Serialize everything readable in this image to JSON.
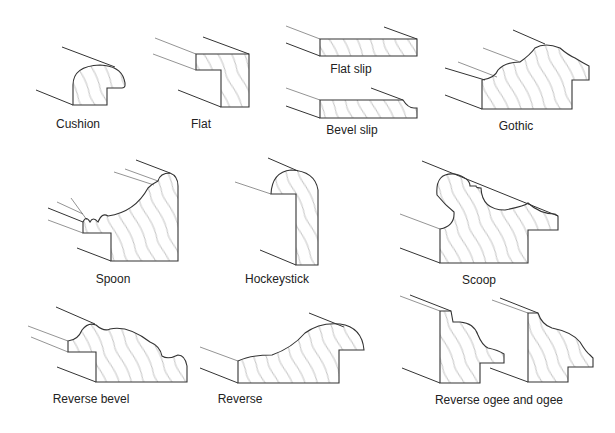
{
  "diagram": {
    "profiles": [
      {
        "id": "cushion",
        "label": "Cushion",
        "label_x": 78,
        "label_y": 117
      },
      {
        "id": "flat",
        "label": "Flat",
        "label_x": 201,
        "label_y": 117
      },
      {
        "id": "flat-slip",
        "label": "Flat slip",
        "label_x": 351,
        "label_y": 62
      },
      {
        "id": "bevel-slip",
        "label": "Bevel slip",
        "label_x": 352,
        "label_y": 123
      },
      {
        "id": "gothic",
        "label": "Gothic",
        "label_x": 516,
        "label_y": 119
      },
      {
        "id": "spoon",
        "label": "Spoon",
        "label_x": 113,
        "label_y": 272
      },
      {
        "id": "hockeystick",
        "label": "Hockeystick",
        "label_x": 277,
        "label_y": 272
      },
      {
        "id": "scoop",
        "label": "Scoop",
        "label_x": 479,
        "label_y": 273
      },
      {
        "id": "reverse-bevel",
        "label": "Reverse bevel",
        "label_x": 91,
        "label_y": 392
      },
      {
        "id": "reverse",
        "label": "Reverse",
        "label_x": 240,
        "label_y": 392
      },
      {
        "id": "reverse-ogee-and-ogee",
        "label": "Reverse ogee and ogee",
        "label_x": 499,
        "label_y": 393
      }
    ],
    "colors": {
      "line": "#333333",
      "grain": "#999999",
      "background": "#ffffff"
    }
  }
}
